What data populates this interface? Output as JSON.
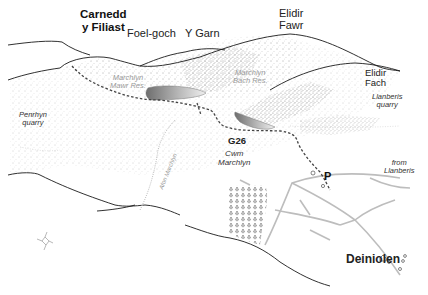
{
  "map": {
    "peaks": [
      {
        "id": "carnedd-y-filiast",
        "line1": "Carnedd",
        "line2": "y Filiast"
      },
      {
        "id": "foel-goch",
        "label": "Foel-goch"
      },
      {
        "id": "y-garn",
        "label": "Y Garn"
      },
      {
        "id": "elidir-fawr",
        "line1": "Elidir",
        "line2": "Fawr"
      },
      {
        "id": "elidir-fach",
        "line1": "Elidir",
        "line2": "Fach"
      }
    ],
    "reservoirs": [
      {
        "id": "marchlyn-mawr",
        "line1": "Marchlyn",
        "line2": "Mawr Res."
      },
      {
        "id": "marchlyn-bach",
        "line1": "Marchlyn",
        "line2": "Bach Res."
      }
    ],
    "places": [
      {
        "id": "penrhyn-quarry",
        "line1": "Penrhyn",
        "line2": "quarry"
      },
      {
        "id": "llanberis-quarry",
        "line1": "Llanberis",
        "line2": "quarry"
      },
      {
        "id": "cwm-marchlyn",
        "line1": "Cwm",
        "line2": "Marchlyn"
      },
      {
        "id": "from-llanberis",
        "line1": "from",
        "line2": "Llanberis"
      }
    ],
    "river": {
      "label": "Afon Marchlyn"
    },
    "route": {
      "label": "G26"
    },
    "parking": {
      "label": "P"
    },
    "town": {
      "label": "Deiniolen"
    },
    "compass": {
      "n": "N",
      "e": "E",
      "s": "S",
      "w": "W"
    },
    "colors": {
      "ink": "#1a1a1a",
      "stipple": "#8c8c8c",
      "water": "#9a9a9a",
      "route": "#444444",
      "road": "#bdbdbd"
    }
  }
}
